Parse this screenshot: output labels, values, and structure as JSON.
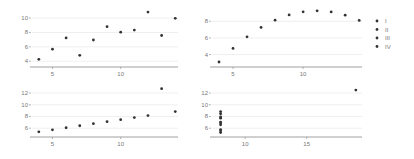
{
  "chart_data": [
    {
      "type": "scatter",
      "series_name": "I",
      "x": [
        10,
        8,
        13,
        9,
        11,
        14,
        6,
        4,
        12,
        7,
        5
      ],
      "y": [
        8.04,
        6.95,
        7.58,
        8.81,
        8.33,
        9.96,
        7.24,
        4.26,
        10.84,
        4.82,
        5.68
      ],
      "xticks": [
        5,
        10
      ],
      "yticks": [
        4,
        6,
        8,
        10
      ],
      "xlim": [
        3.5,
        14.2
      ],
      "ylim": [
        3.2,
        11.4
      ],
      "grid": "horizontal"
    },
    {
      "type": "scatter",
      "series_name": "II",
      "x": [
        10,
        8,
        13,
        9,
        11,
        14,
        6,
        4,
        12,
        7,
        5
      ],
      "y": [
        9.14,
        8.14,
        8.74,
        8.77,
        9.26,
        8.1,
        6.13,
        3.1,
        9.13,
        7.26,
        4.74
      ],
      "xticks": [
        5,
        10
      ],
      "yticks": [
        4,
        6,
        8
      ],
      "xlim": [
        3.5,
        14.2
      ],
      "ylim": [
        2.5,
        9.6
      ],
      "grid": "horizontal"
    },
    {
      "type": "scatter",
      "series_name": "III",
      "x": [
        10,
        8,
        13,
        9,
        11,
        14,
        6,
        4,
        12,
        7,
        5
      ],
      "y": [
        7.46,
        6.77,
        12.74,
        7.11,
        7.81,
        8.84,
        6.08,
        5.39,
        8.15,
        6.42,
        5.73
      ],
      "xticks": [
        5,
        10
      ],
      "yticks": [
        6,
        8,
        10,
        12
      ],
      "xlim": [
        3.5,
        14.2
      ],
      "ylim": [
        4.5,
        13.2
      ],
      "grid": "horizontal"
    },
    {
      "type": "scatter",
      "series_name": "IV",
      "x": [
        8,
        8,
        8,
        8,
        8,
        8,
        8,
        19,
        8,
        8,
        8
      ],
      "y": [
        6.58,
        5.76,
        7.71,
        8.84,
        8.47,
        7.04,
        5.25,
        12.5,
        5.56,
        7.91,
        6.89
      ],
      "xticks": [
        10,
        15
      ],
      "yticks": [
        6,
        8,
        10,
        12
      ],
      "xlim": [
        7.3,
        19.5
      ],
      "ylim": [
        4.5,
        13.2
      ],
      "grid": "horizontal"
    }
  ],
  "legend": {
    "position": "right",
    "items": [
      "I",
      "II",
      "III",
      "IV"
    ]
  },
  "colors": {
    "point": "#333333",
    "grid": "#ebebeb",
    "axis": "#888888",
    "tick_text": "#777777"
  }
}
